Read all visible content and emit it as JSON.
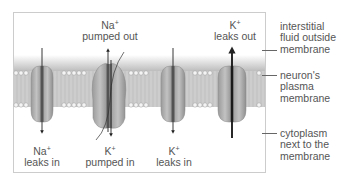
{
  "diagram": {
    "top_labels": [
      {
        "ion": "Na",
        "charge": "+",
        "action": "pumped out"
      },
      {
        "ion": "K",
        "charge": "+",
        "action": "leaks out"
      }
    ],
    "bottom_labels": [
      {
        "ion": "Na",
        "charge": "+",
        "action": "leaks in"
      },
      {
        "ion": "K",
        "charge": "+",
        "action": "pumped in"
      },
      {
        "ion": "K",
        "charge": "+",
        "action": "leaks in"
      }
    ],
    "side_labels": [
      {
        "line1": "interstitial",
        "line2": "fluid outside",
        "line3": "membrane"
      },
      {
        "line1": "neuron's",
        "line2": "plasma",
        "line3": "membrane"
      },
      {
        "line1": "cytoplasm",
        "line2": "next to the",
        "line3": "membrane"
      }
    ],
    "proteins": [
      {
        "type": "channel",
        "ion": "Na+",
        "direction": "in"
      },
      {
        "type": "pump",
        "ion": "Na+/K+",
        "direction": "both"
      },
      {
        "type": "channel",
        "ion": "K+",
        "direction": "in"
      },
      {
        "type": "channel",
        "ion": "K+",
        "direction": "out"
      }
    ],
    "colors": {
      "protein": "#a8a8a8",
      "protein_dark": "#7a7a7a",
      "membrane_band": "#cfcfcf",
      "lipid_head": "#f2f2f2",
      "arrow": "#222222",
      "frame": "#cccccc",
      "text": "#555555"
    }
  }
}
